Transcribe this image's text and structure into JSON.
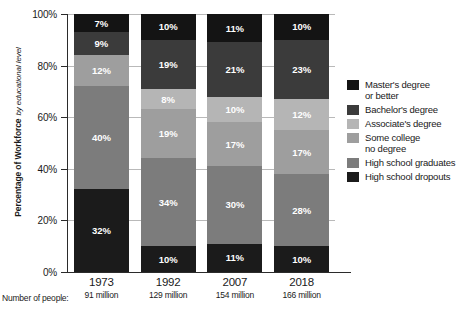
{
  "chart_data": {
    "type": "bar",
    "subtype": "stacked-bar-100",
    "title": "",
    "xlabel": "",
    "ylabel": "Percentage of Workforce",
    "ylabel_sub": "by educational level",
    "ylim": [
      0,
      100
    ],
    "yticks": [
      "0%",
      "20%",
      "40%",
      "60%",
      "80%",
      "100%"
    ],
    "ytick_values": [
      0,
      20,
      40,
      60,
      80,
      100
    ],
    "grid": true,
    "legend_position": "right",
    "categories": [
      "1973",
      "1992",
      "2007",
      "2018"
    ],
    "category_sublabels": [
      "91 million",
      "129 million",
      "154 million",
      "166 million"
    ],
    "sublabel_prefix": "Number of people:",
    "series": [
      {
        "name": "High school dropouts",
        "color": "#1b1b1b",
        "values": [
          32,
          10,
          11,
          10
        ],
        "labels": [
          "32%",
          "10%",
          "11%",
          "10%"
        ]
      },
      {
        "name": "High school graduates",
        "color": "#7c7c7c",
        "values": [
          40,
          34,
          30,
          28
        ],
        "labels": [
          "40%",
          "34%",
          "30%",
          "28%"
        ]
      },
      {
        "name": "Some college\nno degree",
        "color": "#9e9e9e",
        "values": [
          12,
          19,
          17,
          17
        ],
        "labels": [
          "12%",
          "19%",
          "17%",
          "17%"
        ]
      },
      {
        "name": "Associate's degree",
        "color": "#b5b5b5",
        "values": [
          0,
          8,
          10,
          12
        ],
        "labels": [
          "",
          "8%",
          "10%",
          "12%"
        ]
      },
      {
        "name": "Bachelor's degree",
        "color": "#3b3b3b",
        "values": [
          9,
          19,
          21,
          23
        ],
        "labels": [
          "9%",
          "19%",
          "21%",
          "23%"
        ]
      },
      {
        "name": "Master's degree or better",
        "color": "#141414",
        "values": [
          7,
          10,
          11,
          10
        ],
        "labels": [
          "7%",
          "10%",
          "11%",
          "10%"
        ]
      }
    ]
  },
  "legend": {
    "items": [
      {
        "label_line1": "Master's degree",
        "label_line2": "or better",
        "color": "#141414"
      },
      {
        "label_line1": "Bachelor's degree",
        "label_line2": "",
        "color": "#3b3b3b"
      },
      {
        "label_line1": "Associate's degree",
        "label_line2": "",
        "color": "#b5b5b5"
      },
      {
        "label_line1": "Some college",
        "label_line2": "no degree",
        "color": "#9e9e9e"
      },
      {
        "label_line1": "High school graduates",
        "label_line2": "",
        "color": "#7c7c7c"
      },
      {
        "label_line1": "High school dropouts",
        "label_line2": "",
        "color": "#1b1b1b"
      }
    ]
  },
  "colors": {
    "axis": "#2b2b2b",
    "grid": "#b9b9b9",
    "background": "#ffffff",
    "label_text": "#ffffff"
  }
}
